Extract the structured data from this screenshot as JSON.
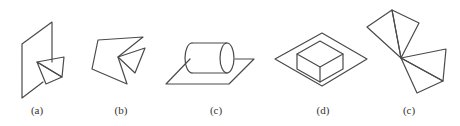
{
  "figure": {
    "panels": [
      {
        "id": "a",
        "label": "(a)",
        "description": "vertical parallelogram plane with two triangles sharing an edge intersecting it",
        "label_x": 37
      },
      {
        "id": "b",
        "label": "(b)",
        "description": "folded planar polygon with triangle",
        "label_x": 121
      },
      {
        "id": "c",
        "label": "(c)",
        "description": "cylinder lying on a parallelogram plane",
        "label_x": 216
      },
      {
        "id": "d",
        "label": "(d)",
        "description": "box sitting on a diamond-shaped plane",
        "label_x": 323
      },
      {
        "id": "e",
        "label": "(c)",
        "description": "four triangles meeting at a single vertex (two pairs)",
        "label_x": 409
      }
    ],
    "stroke_color": "#4a4a4a",
    "background": "#ffffff"
  }
}
